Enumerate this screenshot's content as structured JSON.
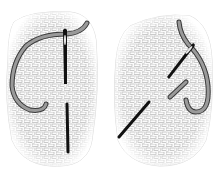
{
  "figure": {
    "colors": {
      "background": "#ffffff",
      "weave": "#b8b8b8",
      "weave_dark": "#8a8a8a",
      "thread": "#9a9a9a",
      "thread_outline": "#3a3a3a",
      "stitch": "#111111",
      "needle": "#111111"
    },
    "panels": [
      {
        "id": "step-1",
        "label": "Vertical stitch with needle and thread loop"
      },
      {
        "id": "step-2",
        "label": "Diagonal stitch with needle and thread loop"
      }
    ]
  }
}
